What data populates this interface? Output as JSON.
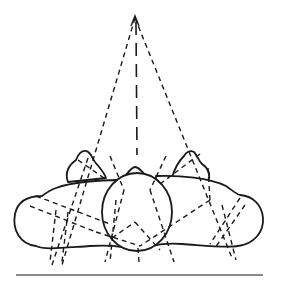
{
  "figure": {
    "colors": {
      "ink": "#1a1a1a",
      "ground": "#8a8a8a",
      "background": "#ffffff"
    },
    "apex": {
      "x": 135,
      "y": 18
    },
    "head": {
      "cx": 137,
      "cy": 212,
      "rx": 35,
      "ry": 39
    },
    "ground_line": {
      "x1": 16,
      "y1": 275,
      "x2": 263,
      "y2": 275
    },
    "converging_lines": [
      {
        "from": [
          135,
          18
        ],
        "to": [
          62,
          265
        ]
      },
      {
        "from": [
          135,
          18
        ],
        "to": [
          232,
          258
        ]
      },
      {
        "from": [
          135,
          18
        ],
        "to": [
          136,
          155
        ]
      }
    ],
    "dashed_lines": [
      [
        88,
        158,
        52,
        265
      ],
      [
        110,
        156,
        124,
        190
      ],
      [
        124,
        190,
        105,
        262
      ],
      [
        166,
        156,
        150,
        190
      ],
      [
        150,
        190,
        174,
        262
      ],
      [
        78,
        160,
        104,
        178
      ],
      [
        200,
        154,
        160,
        184
      ],
      [
        36,
        196,
        110,
        224
      ],
      [
        30,
        206,
        96,
        232
      ],
      [
        96,
        232,
        140,
        246
      ],
      [
        210,
        200,
        140,
        246
      ],
      [
        208,
        168,
        210,
        200
      ],
      [
        112,
        238,
        135,
        222
      ],
      [
        135,
        222,
        160,
        250
      ],
      [
        240,
        198,
        210,
        244
      ],
      [
        245,
        205,
        215,
        248
      ],
      [
        228,
        210,
        236,
        260
      ],
      [
        225,
        230,
        215,
        245
      ],
      [
        56,
        210,
        50,
        262
      ],
      [
        66,
        218,
        62,
        260
      ],
      [
        112,
        200,
        116,
        250
      ]
    ]
  }
}
